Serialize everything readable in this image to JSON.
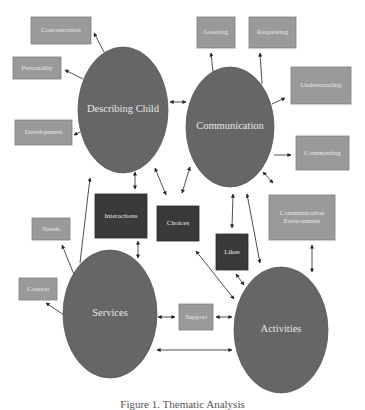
{
  "colors": {
    "background": "#ffffff",
    "ellipse_fill": "#666666",
    "ellipse_stroke": "#5a5a5a",
    "light_box_fill": "#9a9a9a",
    "light_box_stroke": "#808080",
    "dark_box_fill": "#3a3a3a",
    "dark_box_stroke": "#2a2a2a",
    "label_text": "#e8e8e8",
    "arrow": "#222222"
  },
  "ellipses": [
    {
      "id": "describing-child",
      "label": "Describing Child",
      "cx": 123,
      "cy": 110,
      "rx": 45,
      "ry": 63
    },
    {
      "id": "communication",
      "label": "Communication",
      "cx": 230,
      "cy": 127,
      "rx": 44,
      "ry": 60
    },
    {
      "id": "services",
      "label": "Services",
      "cx": 110,
      "cy": 314,
      "rx": 47,
      "ry": 64
    },
    {
      "id": "activities",
      "label": "Activities",
      "cx": 281,
      "cy": 330,
      "rx": 47,
      "ry": 63
    }
  ],
  "boxes": [
    {
      "id": "concentration",
      "label": "Concentration",
      "style": "light",
      "x": 31,
      "y": 17,
      "w": 60,
      "h": 27
    },
    {
      "id": "personality",
      "label": "Personality",
      "style": "light",
      "x": 13,
      "y": 57,
      "w": 48,
      "h": 22
    },
    {
      "id": "development",
      "label": "Development",
      "style": "light",
      "x": 15,
      "y": 120,
      "w": 57,
      "h": 25
    },
    {
      "id": "greeting",
      "label": "Greeting",
      "style": "light",
      "x": 197,
      "y": 17,
      "w": 38,
      "h": 31
    },
    {
      "id": "requesting",
      "label": "Requesting",
      "style": "light",
      "x": 249,
      "y": 17,
      "w": 47,
      "h": 31
    },
    {
      "id": "understanding",
      "label": "Understanding",
      "style": "light",
      "x": 291,
      "y": 67,
      "w": 60,
      "h": 37
    },
    {
      "id": "commenting",
      "label": "Commenting",
      "style": "light",
      "x": 296,
      "y": 136,
      "w": 53,
      "h": 34
    },
    {
      "id": "communication-environment",
      "label": "Communication Environment",
      "label_lines": [
        "Communication",
        "Environment"
      ],
      "style": "light",
      "x": 269,
      "y": 195,
      "w": 66,
      "h": 45
    },
    {
      "id": "needs",
      "label": "Needs",
      "style": "light",
      "x": 32,
      "y": 218,
      "w": 38,
      "h": 22
    },
    {
      "id": "context",
      "label": "Context",
      "style": "light",
      "x": 19,
      "y": 278,
      "w": 38,
      "h": 22
    },
    {
      "id": "interactions",
      "label": "Interactions",
      "style": "dark",
      "x": 95,
      "y": 194,
      "w": 52,
      "h": 44
    },
    {
      "id": "choices",
      "label": "Choices",
      "style": "dark",
      "x": 157,
      "y": 206,
      "w": 42,
      "h": 35
    },
    {
      "id": "likes",
      "label": "Likes",
      "style": "dark",
      "x": 216,
      "y": 234,
      "w": 32,
      "h": 36
    },
    {
      "id": "support",
      "label": "Support",
      "style": "light",
      "x": 179,
      "y": 304,
      "w": 34,
      "h": 26
    }
  ],
  "arrows": [
    {
      "from": "describing-child",
      "to": "concentration",
      "x1": 104,
      "y1": 52,
      "x2": 94,
      "y2": 33,
      "heads": "end"
    },
    {
      "from": "describing-child",
      "to": "personality",
      "x1": 83,
      "y1": 79,
      "x2": 65,
      "y2": 70,
      "heads": "end"
    },
    {
      "from": "describing-child",
      "to": "development",
      "x1": 80,
      "y1": 132,
      "x2": 74,
      "y2": 135,
      "heads": "end"
    },
    {
      "from": "communication",
      "to": "describing-child",
      "x1": 186,
      "y1": 102,
      "x2": 170,
      "y2": 102,
      "heads": "both"
    },
    {
      "from": "communication",
      "to": "greeting",
      "x1": 213,
      "y1": 72,
      "x2": 211,
      "y2": 53,
      "heads": "end"
    },
    {
      "from": "communication",
      "to": "requesting",
      "x1": 262,
      "y1": 84,
      "x2": 260,
      "y2": 53,
      "heads": "end"
    },
    {
      "from": "communication",
      "to": "understanding",
      "x1": 272,
      "y1": 104,
      "x2": 285,
      "y2": 98,
      "heads": "end"
    },
    {
      "from": "communication",
      "to": "commenting",
      "x1": 274,
      "y1": 155,
      "x2": 291,
      "y2": 155,
      "heads": "end"
    },
    {
      "from": "communication",
      "to": "communication-environment",
      "x1": 263,
      "y1": 172,
      "x2": 273,
      "y2": 183,
      "heads": "both"
    },
    {
      "from": "describing-child",
      "to": "interactions",
      "x1": 135,
      "y1": 172,
      "x2": 135,
      "y2": 189,
      "heads": "both"
    },
    {
      "from": "describing-child",
      "to": "choices",
      "x1": 155,
      "y1": 168,
      "x2": 166,
      "y2": 195,
      "heads": "both"
    },
    {
      "from": "communication",
      "to": "choices",
      "x1": 190,
      "y1": 167,
      "x2": 182,
      "y2": 193,
      "heads": "both"
    },
    {
      "from": "communication",
      "to": "likes",
      "x1": 233,
      "y1": 194,
      "x2": 232,
      "y2": 228,
      "heads": "both"
    },
    {
      "from": "communication",
      "to": "activities",
      "x1": 247,
      "y1": 194,
      "x2": 260,
      "y2": 263,
      "heads": "both"
    },
    {
      "from": "communication-environment",
      "to": "activities",
      "x1": 312,
      "y1": 245,
      "x2": 312,
      "y2": 272,
      "heads": "both"
    },
    {
      "from": "likes",
      "to": "activities",
      "x1": 236,
      "y1": 274,
      "x2": 244,
      "y2": 285,
      "heads": "both"
    },
    {
      "from": "choices",
      "to": "activities",
      "x1": 196,
      "y1": 251,
      "x2": 234,
      "y2": 299,
      "heads": "both"
    },
    {
      "from": "services",
      "to": "describing-child",
      "x1": 80,
      "y1": 263,
      "x2": 90,
      "y2": 178,
      "heads": "end"
    },
    {
      "from": "services",
      "to": "needs",
      "x1": 75,
      "y1": 277,
      "x2": 62,
      "y2": 245,
      "heads": "end"
    },
    {
      "from": "services",
      "to": "context",
      "x1": 64,
      "y1": 315,
      "x2": 46,
      "y2": 303,
      "heads": "end"
    },
    {
      "from": "services",
      "to": "interactions",
      "x1": 138,
      "y1": 258,
      "x2": 138,
      "y2": 241,
      "heads": "both"
    },
    {
      "from": "services",
      "to": "support",
      "x1": 158,
      "y1": 317,
      "x2": 175,
      "y2": 317,
      "heads": "both"
    },
    {
      "from": "support",
      "to": "activities",
      "x1": 216,
      "y1": 317,
      "x2": 232,
      "y2": 317,
      "heads": "both"
    },
    {
      "from": "services",
      "to": "activities",
      "x1": 157,
      "y1": 350,
      "x2": 232,
      "y2": 350,
      "heads": "both"
    }
  ],
  "caption": "Figure 1. Thematic Analysis"
}
